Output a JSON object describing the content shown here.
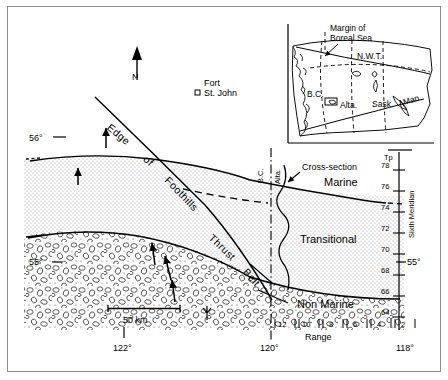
{
  "figure": {
    "type": "geological-facies-map",
    "region": "Northeastern British Columbia / Northwestern Alberta, Canada"
  },
  "main_map": {
    "north_arrow_label": "N",
    "city": {
      "name_line1": "Fort",
      "name_line2": "St. John",
      "symbol": "open-square"
    },
    "structural_label": "Edge of Foothills Thrust Belt",
    "structural_label_parts": [
      "Edge",
      "of",
      "Foothills",
      "Thrust",
      "Belt"
    ],
    "cross_section_label": "Cross-section",
    "province_left": "B.C.",
    "province_right": "Alta.",
    "facies": [
      {
        "name": "Marine",
        "pattern": "stipple"
      },
      {
        "name": "Transitional",
        "pattern": "stipple"
      },
      {
        "name": "Non Marine",
        "pattern": "pebble-conglomerate"
      }
    ],
    "scale_bar": {
      "label": "50 km"
    },
    "latitude_labels": [
      {
        "value": "56°",
        "side": "left"
      },
      {
        "value": "55°",
        "side": "left"
      },
      {
        "value": "55°",
        "side": "right"
      }
    ],
    "longitude_labels": [
      {
        "value": "122°"
      },
      {
        "value": "120°"
      },
      {
        "value": "118°"
      }
    ],
    "township_axis": {
      "header": "Tp",
      "meridian_label": "Sixth Meridian",
      "ticks": [
        "78",
        "76",
        "74",
        "72",
        "70",
        "68",
        "66",
        "64"
      ]
    },
    "range_axis": {
      "label": "Range",
      "ticks": [
        "12",
        "10",
        "8",
        "6",
        "4",
        "2"
      ]
    }
  },
  "inset_map": {
    "annotation_line1": "Margin of",
    "annotation_line2": "Boreal Sea",
    "regions": [
      {
        "abbr": "N.W.T."
      },
      {
        "abbr": "B.C."
      },
      {
        "abbr": "Alta."
      },
      {
        "abbr": "Sask."
      },
      {
        "abbr": "Man."
      }
    ]
  },
  "colors": {
    "ink": "#000000",
    "frame": "#8d8d8d",
    "stipple": "#d8d8d8",
    "paper": "#ffffff"
  }
}
